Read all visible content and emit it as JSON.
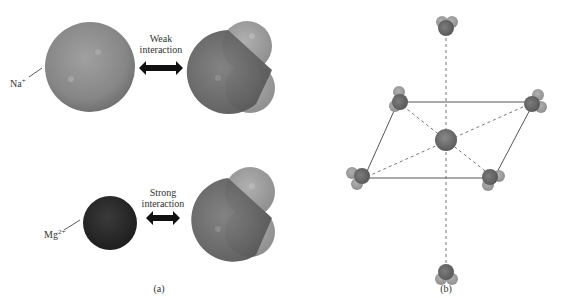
{
  "panel_a": {
    "caption": "(a)",
    "top": {
      "ion": "Na",
      "charge": "+",
      "interaction_line1": "Weak",
      "interaction_line2": "interaction"
    },
    "bottom": {
      "ion": "Mg",
      "charge": "2+",
      "interaction_line1": "Strong",
      "interaction_line2": "interaction"
    }
  },
  "panel_b": {
    "caption": "(b)"
  },
  "colors": {
    "na_ion": "#8a8a8a",
    "mg_ion": "#2a2a2a",
    "oxygen": "#6e6e6e",
    "hydrogen": "#9c9c9c",
    "arrow": "#111111",
    "line": "#555555"
  }
}
